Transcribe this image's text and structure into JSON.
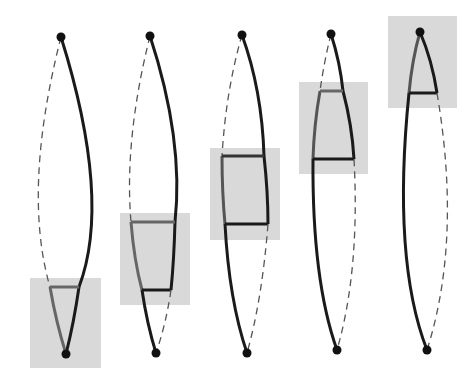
{
  "diagram": {
    "colors": {
      "background": "#ffffff",
      "box_fill": "#d9d9d9",
      "solid_stroke": "#1a1a1a",
      "gray_stroke": "#666666",
      "dashed_stroke": "#555555",
      "node_fill": "#111111"
    },
    "figures": [
      {
        "id": 1,
        "top": [
          61,
          37
        ],
        "bottom": [
          66,
          354
        ],
        "box": [
          30,
          278,
          71,
          90
        ]
      },
      {
        "id": 2,
        "top": [
          150,
          36
        ],
        "bottom": [
          156,
          353
        ],
        "box": [
          120,
          213,
          70,
          92
        ]
      },
      {
        "id": 3,
        "top": [
          242,
          35
        ],
        "bottom": [
          247,
          353
        ],
        "box": [
          210,
          148,
          70,
          92
        ]
      },
      {
        "id": 4,
        "top": [
          331,
          34
        ],
        "bottom": [
          337,
          350
        ],
        "box": [
          299,
          82,
          69,
          92
        ]
      },
      {
        "id": 5,
        "top": [
          420,
          32
        ],
        "bottom": [
          427,
          350
        ],
        "box": [
          388,
          16,
          69,
          92
        ]
      }
    ]
  }
}
